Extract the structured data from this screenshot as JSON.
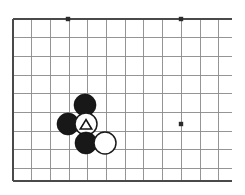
{
  "figure": {
    "board_background_color": "#ffffff",
    "grid_line_color": "#8a8a8a",
    "edge_line_color": "#4a4a4a",
    "black_stone_color": "#181818",
    "white_stone_color": "#ffffff",
    "stone_outline_color": "#1a1a1a",
    "marker_color": "#141414"
  },
  "board": {
    "description": "Partial Go board showing the upper-left portion of a 19x19 goban",
    "origin_x": 13,
    "origin_y": 19,
    "cell_size": 18.7,
    "columns": 12,
    "rows": 9,
    "left_edge_x": 13,
    "top_edge_y": 19,
    "bottom_edge_y": 181,
    "right_overflow_x": 232,
    "edge_sides": [
      "left",
      "top",
      "bottom"
    ]
  },
  "star_points": [
    {
      "name": "star-point-upper-left",
      "col": 3,
      "row": 0,
      "x": 68,
      "y": 19
    },
    {
      "name": "star-point-upper-right",
      "col": 9,
      "row": 0,
      "x": 181,
      "y": 19
    },
    {
      "name": "star-point-middle-right",
      "col": 9,
      "row": 5.6,
      "x": 181,
      "y": 124
    }
  ],
  "stones": [
    {
      "id": "black-stone-top",
      "color": "black",
      "x": 85,
      "y": 105,
      "radius": 11,
      "marker": "none"
    },
    {
      "id": "black-stone-left",
      "color": "black",
      "x": 68,
      "y": 124,
      "radius": 11,
      "marker": "none"
    },
    {
      "id": "white-stone-marked",
      "color": "white",
      "x": 86,
      "y": 124,
      "radius": 11,
      "marker": "triangle"
    },
    {
      "id": "black-stone-bottom",
      "color": "black",
      "x": 86,
      "y": 143,
      "radius": 11,
      "marker": "none"
    },
    {
      "id": "white-stone-right",
      "color": "white",
      "x": 105,
      "y": 143,
      "radius": 11,
      "marker": "none"
    }
  ],
  "markers": {
    "triangle": {
      "name": "triangle-marker",
      "size": 11,
      "description": "black outlined triangle on white stone"
    }
  }
}
